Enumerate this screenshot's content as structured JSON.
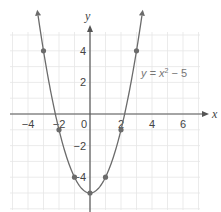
{
  "chart_data": {
    "type": "line",
    "title": "",
    "xlabel": "x",
    "ylabel": "y",
    "annotation": "y = x² − 5",
    "equation": {
      "prefix": "y = x",
      "exp": "2",
      "suffix": " − 5"
    },
    "x_ticks": [
      "−4",
      "−2",
      "0",
      "2",
      "4",
      "6"
    ],
    "y_ticks": [
      "4",
      "2",
      "−2",
      "−4"
    ],
    "xlim": [
      -5,
      7
    ],
    "ylim": [
      -6,
      5.5
    ],
    "grid": true,
    "legend": "none",
    "series": [
      {
        "name": "y = x^2 - 5",
        "x": [
          -3,
          -2,
          -1,
          0,
          1,
          2,
          3
        ],
        "y": [
          4,
          -1,
          -4,
          -5,
          -4,
          -1,
          4
        ]
      }
    ],
    "colors": {
      "curve": "#6b6b6b",
      "points": "#6b6b6b",
      "grid": "#e6e6e6",
      "axis": "#555555"
    }
  }
}
